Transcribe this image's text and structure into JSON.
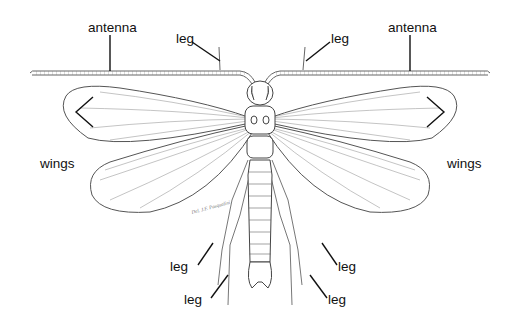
{
  "diagram": {
    "labels": {
      "antenna_left": "antenna",
      "antenna_right": "antenna",
      "leg_front_left": "leg",
      "leg_front_right": "leg",
      "wings_left": "wings",
      "wings_right": "wings",
      "leg_mid_left": "leg",
      "leg_hind_left": "leg",
      "leg_mid_right": "leg",
      "leg_hind_right": "leg"
    },
    "signature": "Del. J.F. Pasqualini",
    "colors": {
      "line": "#1a1a1a",
      "drawing": "#555555",
      "background": "#ffffff"
    }
  }
}
